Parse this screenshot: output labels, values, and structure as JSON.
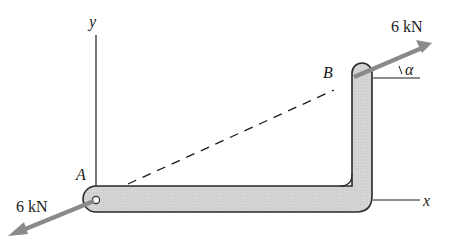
{
  "diagram": {
    "title": "",
    "axes": {
      "y_label": "y",
      "x_label": "x"
    },
    "points": {
      "A": "A",
      "B": "B"
    },
    "forces": {
      "at_A": {
        "label": "6 kN",
        "direction": "down-left"
      },
      "at_B": {
        "label": "6 kN",
        "direction": "up-right"
      }
    },
    "angle_label": "α",
    "colors": {
      "member_fill": "#d4d4d4",
      "member_stroke": "#2a2a2a",
      "arrow": "#8a8a8a",
      "line": "#1a1a1a"
    }
  }
}
